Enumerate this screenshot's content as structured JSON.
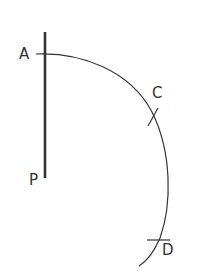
{
  "diagram": {
    "type": "geometric-construction",
    "labels": {
      "A": "A",
      "P": "P",
      "C": "C",
      "D": "D"
    },
    "colors": {
      "stroke": "#333333",
      "background": "#ffffff"
    },
    "elements": [
      {
        "id": "line-AP",
        "kind": "segment",
        "from": "A",
        "to": "P",
        "style": "thick"
      },
      {
        "id": "arc-ACD",
        "kind": "arc",
        "through": [
          "A",
          "C",
          "D"
        ]
      },
      {
        "id": "tick-C",
        "kind": "arc-mark",
        "at": "C"
      },
      {
        "id": "tick-D",
        "kind": "arc-mark",
        "at": "D"
      }
    ]
  }
}
